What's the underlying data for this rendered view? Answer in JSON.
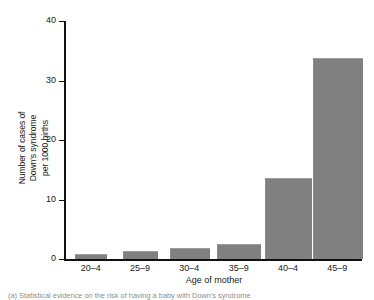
{
  "figure": {
    "caption": "(a) Statistical evidence on the risk of having a baby with Down's syndrome"
  },
  "chart_data": {
    "type": "bar",
    "title": "",
    "categories": [
      "20–4",
      "25–9",
      "30–4",
      "35–9",
      "40–4",
      "45–9"
    ],
    "values": [
      0.7,
      1.1,
      1.6,
      2.3,
      13.5,
      33.7
    ],
    "xlabel": "Age of mother",
    "ylabel": "Number of cases of Down's syndrome per 1000 births",
    "ylabel_lines": [
      "Number of cases of",
      "Down's syndrome",
      "per 1000 births"
    ],
    "yticks": [
      0,
      10,
      20,
      30,
      40
    ],
    "ytick_labels": [
      "0",
      "10",
      "20",
      "30",
      "40"
    ],
    "ylim": [
      0,
      40
    ],
    "grid": false,
    "legend": false,
    "bar_color": "#808080",
    "axis_color": "#111111",
    "background_color": "#ffffff"
  }
}
